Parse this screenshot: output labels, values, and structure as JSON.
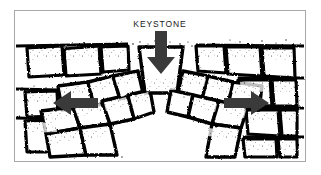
{
  "figure": {
    "title_label": "KEYSTONE",
    "background_color": "#ffffff",
    "frame_color": "#a8a8a8",
    "stone_outline_color": "#000000",
    "stone_fill_color": "#ffffff",
    "arrow_color": "#3a3a3a",
    "label_color": "#1a1a1a"
  },
  "labels": [
    {
      "name": "keystone-label",
      "text": "KEYSTONE",
      "x": 160,
      "y": 27
    }
  ],
  "arrows": [
    {
      "name": "keystone-load-arrow",
      "direction": "down",
      "meaning": "downward load on keystone",
      "x": 161,
      "y_start": 31,
      "y_end": 72,
      "color": "#3a3a3a"
    },
    {
      "name": "left-thrust-arrow",
      "direction": "left",
      "meaning": "outward horizontal thrust at left abutment",
      "y": 103,
      "x_start": 98,
      "x_end": 53,
      "color": "#3a3a3a"
    },
    {
      "name": "right-thrust-arrow",
      "direction": "right",
      "meaning": "outward horizontal thrust at right abutment",
      "y": 103,
      "x_start": 224,
      "x_end": 268,
      "color": "#3a3a3a"
    }
  ],
  "arch": {
    "span_left_x": 72,
    "span_right_x": 250,
    "apex_y": 72,
    "springing_y": 150,
    "keystone_index": 6,
    "voussoir_count": 13
  },
  "stones": {
    "voussoirs": [
      {
        "name": "voussoir-1",
        "points": "41,111 73,107 80,128 46,134"
      },
      {
        "name": "voussoir-2",
        "points": "46,134 80,128 86,152 50,156"
      },
      {
        "name": "voussoir-3",
        "points": "58,86 88,82 94,106 62,110"
      },
      {
        "name": "voussoir-4",
        "points": "73,107 102,101 110,124 80,128"
      },
      {
        "name": "voussoir-5",
        "points": "80,128 110,124 117,152 86,152"
      },
      {
        "name": "voussoir-6",
        "points": "88,82 113,76 120,99 94,106"
      },
      {
        "name": "voussoir-7",
        "points": "102,101 128,95 134,119 110,124"
      },
      {
        "name": "voussoir-8",
        "points": "113,76 138,71 143,93 120,99"
      },
      {
        "name": "voussoir-9",
        "points": "128,95 150,90 154,112 134,119"
      },
      {
        "name": "keystone",
        "points": "140,48 182,48 176,93 146,93"
      },
      {
        "name": "voussoir-10",
        "points": "183,71 208,76 202,99 178,93"
      },
      {
        "name": "voussoir-11",
        "points": "171,90 193,95 188,117 167,112"
      },
      {
        "name": "voussoir-12",
        "points": "208,76 233,82 228,106 202,99"
      },
      {
        "name": "voussoir-13",
        "points": "193,95 219,101 212,124 188,117"
      },
      {
        "name": "voussoir-14",
        "points": "233,82 262,86 259,110 228,106"
      },
      {
        "name": "voussoir-15",
        "points": "219,101 248,107 241,128 212,124"
      },
      {
        "name": "voussoir-16",
        "points": "212,124 241,128 235,152 206,152"
      }
    ],
    "wall_blocks": [
      {
        "name": "wall-block-left-1",
        "points": "27,48 62,46 64,75 29,77"
      },
      {
        "name": "wall-block-left-2",
        "points": "64,49 99,46 101,74 66,76"
      },
      {
        "name": "wall-block-left-3",
        "points": "101,47 128,46 129,70 103,72"
      },
      {
        "name": "wall-block-left-4",
        "points": "25,92 57,91 58,116 27,117"
      },
      {
        "name": "wall-block-left-5",
        "points": "25,121 58,120 60,152 27,152"
      },
      {
        "name": "wall-block-right-1",
        "points": "196,46 224,46 226,73 198,71"
      },
      {
        "name": "wall-block-right-2",
        "points": "226,47 260,47 262,76 228,74"
      },
      {
        "name": "wall-block-right-3",
        "points": "262,48 294,48 295,78 264,76"
      },
      {
        "name": "wall-block-right-4",
        "points": "238,80 270,80 272,106 240,104"
      },
      {
        "name": "wall-block-right-5",
        "points": "272,80 296,80 297,106 274,106"
      },
      {
        "name": "wall-block-right-6",
        "points": "246,110 278,110 280,136 248,134"
      },
      {
        "name": "wall-block-right-7",
        "points": "280,110 297,110 297,136 282,136"
      },
      {
        "name": "wall-block-right-8",
        "points": "243,139 276,139 277,155 245,155"
      },
      {
        "name": "wall-block-right-9",
        "points": "278,139 297,139 297,155 280,155"
      }
    ],
    "mortar_lines": [
      {
        "name": "mortar-line-top-left",
        "d": "M16,46 L128,44"
      },
      {
        "name": "mortar-line-top-right",
        "d": "M196,45 L304,46"
      },
      {
        "name": "mortar-line-mid-left",
        "d": "M16,89 L58,90"
      },
      {
        "name": "mortar-line-mid-right",
        "d": "M238,78 L304,78"
      },
      {
        "name": "mortar-line-low-right",
        "d": "M246,108 L304,108"
      },
      {
        "name": "mortar-line-bottom-right",
        "d": "M243,137 L304,137"
      },
      {
        "name": "mortar-line-bottom-left",
        "d": "M16,118 L60,119"
      }
    ]
  }
}
